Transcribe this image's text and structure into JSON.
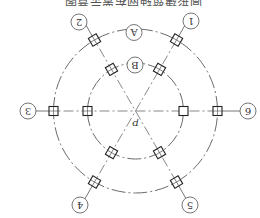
{
  "diagram": {
    "orientation": "rotated 180 degrees",
    "caption": "圆形建筑轴网布置示意图",
    "center_label": "p",
    "rings": [
      {
        "name": "outer",
        "label": "A",
        "radius": 82
      },
      {
        "name": "inner",
        "label": "B",
        "radius": 48
      }
    ],
    "radial_axes": [
      {
        "label": "1"
      },
      {
        "label": "2"
      },
      {
        "label": "3"
      },
      {
        "label": "4"
      },
      {
        "label": "5"
      },
      {
        "label": "6"
      }
    ],
    "colors": {
      "line": "#6a6a6a",
      "column": "#222222",
      "background": "#ffffff"
    }
  }
}
